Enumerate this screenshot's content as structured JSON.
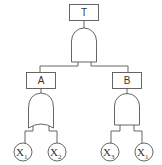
{
  "diagram": {
    "type": "fault-tree",
    "top_event": {
      "label": "T",
      "gate": "AND"
    },
    "intermediate_events": [
      {
        "label": "A",
        "gate": "OR",
        "inputs": [
          "X1",
          "X2"
        ]
      },
      {
        "label": "B",
        "gate": "AND",
        "inputs": [
          "X3",
          "X1"
        ]
      }
    ],
    "basic_events": [
      {
        "base": "X",
        "sub": "1"
      },
      {
        "base": "X",
        "sub": "2"
      },
      {
        "base": "X",
        "sub": "3"
      },
      {
        "base": "X",
        "sub": "1"
      }
    ],
    "colors": {
      "stroke": "#555555",
      "background": "#ffffff"
    }
  }
}
